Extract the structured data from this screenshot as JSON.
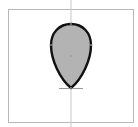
{
  "canvas": {
    "background": "#ffffff",
    "frame_color": "#b8b8b8",
    "guide_color": "#c4c4c4"
  },
  "shape": {
    "name": "egg-shape",
    "fill": "#b3b3b3",
    "stroke": "#111111",
    "stroke_width": 2.4
  },
  "anchors": {
    "color": "#9a9a9a"
  }
}
